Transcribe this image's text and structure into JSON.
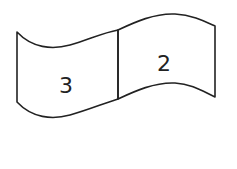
{
  "diagram": {
    "panels": [
      {
        "id": "left",
        "label": "3"
      },
      {
        "id": "right",
        "label": "2"
      }
    ],
    "stroke_color": "#222222",
    "background": "#ffffff"
  }
}
